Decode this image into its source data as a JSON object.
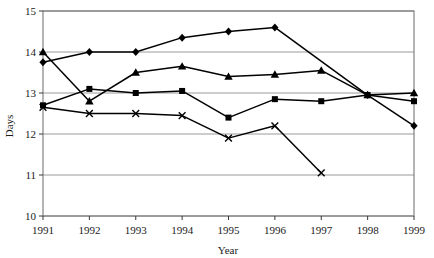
{
  "chart_data": {
    "type": "line",
    "title": "",
    "xlabel": "Year",
    "ylabel": "Days",
    "categories": [
      "1991",
      "1992",
      "1993",
      "1994",
      "1995",
      "1996",
      "1997",
      "1998",
      "1999"
    ],
    "x": [
      1991,
      1992,
      1993,
      1994,
      1995,
      1996,
      1997,
      1998,
      1999
    ],
    "xlim": [
      1991,
      1999
    ],
    "ylim": [
      10,
      15
    ],
    "yticks": [
      10,
      11,
      12,
      13,
      14,
      15
    ],
    "ytick_labels": [
      "10",
      "11",
      "12",
      "13",
      "14",
      "15"
    ],
    "xticks": [
      1991,
      1992,
      1993,
      1994,
      1995,
      1996,
      1997,
      1998,
      1999
    ],
    "xtick_labels": [
      "1991",
      "1992",
      "1993",
      "1994",
      "1995",
      "1996",
      "1997",
      "1998",
      "1999"
    ],
    "grid": true,
    "grid_axis": "y",
    "legend": false,
    "legend_position": "none",
    "series": [
      {
        "name": "series-diamond",
        "marker": "diamond",
        "color": "#000000",
        "values": [
          13.75,
          14.0,
          14.0,
          14.35,
          14.5,
          14.6,
          null,
          12.95,
          12.2
        ],
        "x": [
          1991,
          1992,
          1993,
          1994,
          1995,
          1996,
          null,
          1998,
          1999
        ]
      },
      {
        "name": "series-triangle",
        "marker": "triangle",
        "color": "#000000",
        "values": [
          14.0,
          12.8,
          13.5,
          13.65,
          13.4,
          13.45,
          13.55,
          12.95,
          13.0
        ]
      },
      {
        "name": "series-square",
        "marker": "square",
        "color": "#000000",
        "values": [
          12.7,
          13.1,
          13.0,
          13.05,
          12.4,
          12.85,
          12.8,
          12.95,
          12.8
        ]
      },
      {
        "name": "series-cross",
        "marker": "x",
        "color": "#000000",
        "values": [
          12.65,
          12.5,
          12.5,
          12.45,
          11.9,
          12.2,
          11.05,
          null,
          null
        ]
      }
    ]
  },
  "axis": {
    "y_label": "Days",
    "x_label": "Year"
  }
}
